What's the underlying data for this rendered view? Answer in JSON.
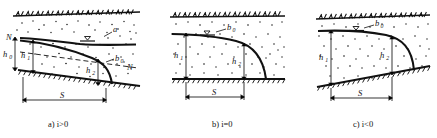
{
  "figure": {
    "kind": "engineering-diagram",
    "ink_color": "#111111",
    "background_color": "#ffffff",
    "panel_count": 3
  },
  "panels": [
    {
      "id": "a",
      "caption": "a) i>0",
      "caption_letter": "a)",
      "caption_condition": "i>0",
      "datum_label_left": "N",
      "datum_label_right": "N",
      "curve_label_upper": "a",
      "curve_label_lower": "b",
      "curve_label_lower_sub": "0",
      "dims": [
        {
          "name": "h",
          "sub": "0"
        },
        {
          "name": "h",
          "sub": "1"
        },
        {
          "name": "h",
          "sub": "2"
        },
        {
          "name": "S",
          "sub": ""
        }
      ],
      "water_table_marker": "triangle-down",
      "ground_hatch": "grass-hatch",
      "base_hatch": "impervious-hatch",
      "soil_fill": "stipple-dots"
    },
    {
      "id": "b",
      "caption": "b) i=0",
      "caption_letter": "b)",
      "caption_condition": "i=0",
      "curve_label_upper": "b",
      "curve_label_upper_sub": "0",
      "dims": [
        {
          "name": "h",
          "sub": "1"
        },
        {
          "name": "h",
          "sub": "2"
        },
        {
          "name": "S",
          "sub": ""
        }
      ],
      "water_table_marker": "triangle-down",
      "ground_hatch": "grass-hatch",
      "base_hatch": "impervious-hatch",
      "soil_fill": "stipple-dots"
    },
    {
      "id": "c",
      "caption": "c) i<0",
      "caption_letter": "c)",
      "caption_condition": "i<0",
      "curve_label_upper": "b",
      "curve_label_upper_sub": "0",
      "dims": [
        {
          "name": "h",
          "sub": "1"
        },
        {
          "name": "h",
          "sub": "2"
        },
        {
          "name": "S",
          "sub": ""
        }
      ],
      "water_table_marker": "triangle-down",
      "ground_hatch": "grass-hatch",
      "base_hatch": "impervious-hatch",
      "soil_fill": "stipple-dots"
    }
  ]
}
